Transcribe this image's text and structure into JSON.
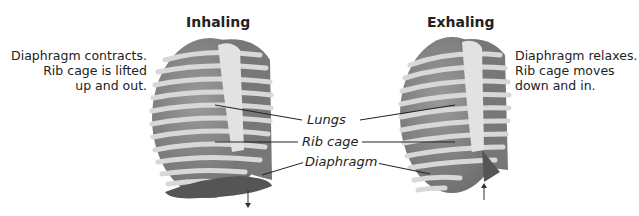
{
  "inhaling": {
    "title": "Inhaling",
    "description": [
      "Diaphragm contracts.",
      "Rib cage is lifted",
      "up and out."
    ],
    "arrow_direction": "down"
  },
  "exhaling": {
    "title": "Exhaling",
    "description": [
      "Diaphragm relaxes.",
      "Rib cage moves",
      "down and in."
    ],
    "arrow_direction": "up"
  },
  "labels": {
    "lungs": "Lungs",
    "rib_cage": "Rib cage",
    "diaphragm": "Diaphragm"
  },
  "colors": {
    "lung": "#8a8a8a",
    "rib": "#d9d9d9",
    "diaphragm": "#555555",
    "sternum": "#e0e0e0"
  }
}
